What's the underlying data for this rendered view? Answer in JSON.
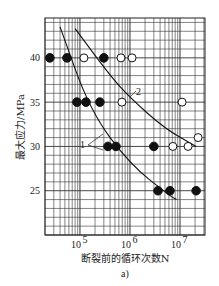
{
  "chart_data": {
    "type": "scatter",
    "title": "",
    "subfigure_label": "a)",
    "xlabel": "断裂前的循环次数N",
    "ylabel": "最大应力/MPa",
    "xscale": "log",
    "xlim": [
      20000,
      31600000
    ],
    "ylim": [
      20,
      44.5
    ],
    "x_ticks": [
      {
        "value": 100000,
        "label": "10^5",
        "base": "10",
        "exp": "5"
      },
      {
        "value": 1000000,
        "label": "10^6",
        "base": "10",
        "exp": "6"
      },
      {
        "value": 10000000,
        "label": "10^7",
        "base": "10",
        "exp": "7"
      }
    ],
    "y_ticks": [
      {
        "value": 25,
        "label": "25"
      },
      {
        "value": 30,
        "label": "30"
      },
      {
        "value": 35,
        "label": "35"
      },
      {
        "value": 40,
        "label": "40"
      }
    ],
    "grid": true,
    "series": [
      {
        "name": "filled",
        "marker": "filled-circle",
        "points": [
          {
            "x": 25000,
            "y": 40
          },
          {
            "x": 55000,
            "y": 40
          },
          {
            "x": 300000,
            "y": 40
          },
          {
            "x": 87000,
            "y": 35
          },
          {
            "x": 132000,
            "y": 35
          },
          {
            "x": 250000,
            "y": 35
          },
          {
            "x": 363000,
            "y": 30
          },
          {
            "x": 525000,
            "y": 30
          },
          {
            "x": 3000000,
            "y": 30
          },
          {
            "x": 3630000,
            "y": 25
          },
          {
            "x": 6300000,
            "y": 25
          },
          {
            "x": 21000000,
            "y": 25
          }
        ]
      },
      {
        "name": "open",
        "marker": "open-circle",
        "points": [
          {
            "x": 120000,
            "y": 40
          },
          {
            "x": 660000,
            "y": 40
          },
          {
            "x": 1100000,
            "y": 40
          },
          {
            "x": 690000,
            "y": 35
          },
          {
            "x": 11000000,
            "y": 35
          },
          {
            "x": 7200000,
            "y": 30
          },
          {
            "x": 14500000,
            "y": 30
          },
          {
            "x": 23000000,
            "y": 31
          }
        ]
      }
    ],
    "curves": [
      {
        "name": "1",
        "points": [
          {
            "x": 40000,
            "y": 43.5
          },
          {
            "x": 160000,
            "y": 34
          },
          {
            "x": 1000000,
            "y": 28
          },
          {
            "x": 6000000,
            "y": 24.5
          },
          {
            "x": 8500000,
            "y": 24
          }
        ]
      },
      {
        "name": "2",
        "points": [
          {
            "x": 80000,
            "y": 43.3
          },
          {
            "x": 400000,
            "y": 38
          },
          {
            "x": 1000000,
            "y": 35.5
          },
          {
            "x": 5000000,
            "y": 32
          },
          {
            "x": 21000000,
            "y": 30
          }
        ]
      }
    ],
    "annotations": [
      "1",
      "2"
    ]
  }
}
